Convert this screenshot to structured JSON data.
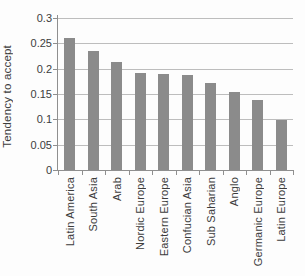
{
  "chart_data": {
    "type": "bar",
    "title": "",
    "xlabel": "",
    "ylabel": "Tendency to accept",
    "categories": [
      "Latin America",
      "South Asia",
      "Arab",
      "Nordic Europe",
      "Eastern Europe",
      "Confucian Asia",
      "Sub Saharian",
      "Anglo",
      "Germanic Europe",
      "Latin Europe"
    ],
    "values": [
      0.26,
      0.234,
      0.214,
      0.192,
      0.19,
      0.187,
      0.172,
      0.154,
      0.138,
      0.098
    ],
    "ylim": [
      0,
      0.3
    ],
    "ytick_step": 0.05,
    "ytick_labels": [
      "0",
      "0.05",
      "0.1",
      "0.15",
      "0.2",
      "0.25",
      "0.3"
    ],
    "grid": "horizontal",
    "legend": "none",
    "bar_color": "#8b8b8b",
    "gridline_color": "#bdbdbd",
    "axis_color": "#8f8f8f",
    "text_color": "#3c3c3c"
  }
}
